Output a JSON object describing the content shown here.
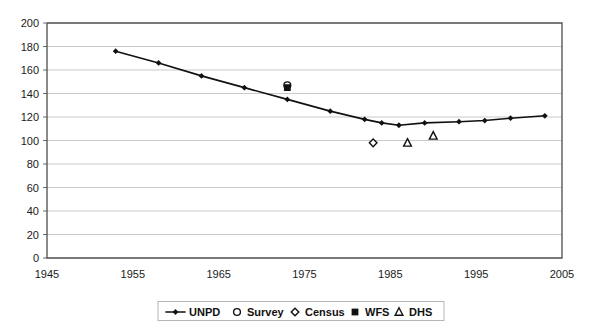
{
  "chart_data": {
    "type": "line",
    "title": "",
    "xlabel": "",
    "ylabel": "",
    "xlim": [
      1945,
      2005
    ],
    "ylim": [
      0,
      200
    ],
    "xticks": [
      1945,
      1955,
      1965,
      1975,
      1985,
      1995,
      2005
    ],
    "yticks": [
      0,
      20,
      40,
      60,
      80,
      100,
      120,
      140,
      160,
      180,
      200
    ],
    "grid": "horizontal",
    "legend_position": "bottom",
    "series": [
      {
        "name": "UNPD",
        "marker": "line-with-diamond",
        "x": [
          1953,
          1958,
          1963,
          1968,
          1973,
          1978,
          1982,
          1984,
          1986,
          1989,
          1993,
          1996,
          1999,
          2003
        ],
        "values": [
          176,
          166,
          155,
          145,
          135,
          125,
          118,
          115,
          113,
          115,
          116,
          117,
          119,
          121
        ]
      },
      {
        "name": "Survey",
        "marker": "open-circle",
        "x": [
          1973
        ],
        "values": [
          147
        ]
      },
      {
        "name": "Census",
        "marker": "open-diamond",
        "x": [
          1983
        ],
        "values": [
          98
        ]
      },
      {
        "name": "WFS",
        "marker": "filled-square",
        "x": [
          1973
        ],
        "values": [
          145
        ]
      },
      {
        "name": "DHS",
        "marker": "open-triangle",
        "x": [
          1987,
          1990
        ],
        "values": [
          98,
          104
        ]
      }
    ]
  },
  "axes": {
    "y_tick_labels": [
      "200",
      "180",
      "160",
      "140",
      "120",
      "100",
      "80",
      "60",
      "40",
      "20",
      "0"
    ],
    "x_tick_labels": [
      "1945",
      "1955",
      "1965",
      "1975",
      "1985",
      "1995",
      "2005"
    ]
  },
  "legend": {
    "entries": [
      {
        "label": "UNPD",
        "marker": "line-with-diamond"
      },
      {
        "label": "Survey",
        "marker": "open-circle"
      },
      {
        "label": "Census",
        "marker": "open-diamond"
      },
      {
        "label": "WFS",
        "marker": "filled-square"
      },
      {
        "label": "DHS",
        "marker": "open-triangle"
      }
    ]
  },
  "colors": {
    "series": "#111111",
    "grid": "#c9c9c9",
    "axis": "#4d4d4d",
    "background": "#ffffff"
  }
}
